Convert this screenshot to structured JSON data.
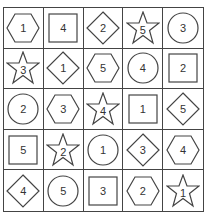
{
  "puzzle": {
    "rows": 5,
    "cols": 5,
    "cells": [
      [
        {
          "shape": "hexagon",
          "number": "1"
        },
        {
          "shape": "square",
          "number": "4"
        },
        {
          "shape": "diamond",
          "number": "2"
        },
        {
          "shape": "star",
          "number": "5"
        },
        {
          "shape": "circle",
          "number": "3"
        }
      ],
      [
        {
          "shape": "star",
          "number": "3"
        },
        {
          "shape": "diamond",
          "number": "1"
        },
        {
          "shape": "hexagon",
          "number": "5"
        },
        {
          "shape": "circle",
          "number": "4"
        },
        {
          "shape": "square",
          "number": "2"
        }
      ],
      [
        {
          "shape": "circle",
          "number": "2"
        },
        {
          "shape": "hexagon",
          "number": "3"
        },
        {
          "shape": "star",
          "number": "4"
        },
        {
          "shape": "square",
          "number": "1"
        },
        {
          "shape": "diamond",
          "number": "5"
        }
      ],
      [
        {
          "shape": "square",
          "number": "5"
        },
        {
          "shape": "star",
          "number": "2"
        },
        {
          "shape": "circle",
          "number": "1"
        },
        {
          "shape": "diamond",
          "number": "3"
        },
        {
          "shape": "hexagon",
          "number": "4"
        }
      ],
      [
        {
          "shape": "diamond",
          "number": "4"
        },
        {
          "shape": "circle",
          "number": "5"
        },
        {
          "shape": "square",
          "number": "3"
        },
        {
          "shape": "hexagon",
          "number": "2"
        },
        {
          "shape": "star",
          "number": "1"
        }
      ]
    ]
  },
  "colors": {
    "stroke": "#444444",
    "text": "#333333",
    "background": "#ffffff"
  }
}
